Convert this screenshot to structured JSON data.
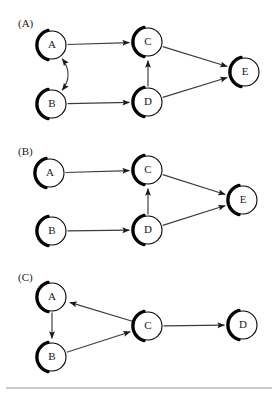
{
  "figure": {
    "title": "",
    "background_color": "#ffffff",
    "node_fill": "#ffffff",
    "node_stroke": "#000000",
    "edge_color": "#3c3c3c",
    "label_color": "#1a1a1a",
    "divider_color": "#8a8a8a",
    "node_radius": 14,
    "width": 277,
    "height": 394
  },
  "panels": [
    {
      "id": "panel-a",
      "label": "(A)",
      "label_x": 18,
      "label_y": 27,
      "nodes": [
        {
          "id": "A",
          "label": "A",
          "x": 52,
          "y": 45
        },
        {
          "id": "B",
          "label": "B",
          "x": 52,
          "y": 104
        },
        {
          "id": "C",
          "label": "C",
          "x": 148,
          "y": 42
        },
        {
          "id": "D",
          "label": "D",
          "x": 148,
          "y": 102
        },
        {
          "id": "E",
          "label": "E",
          "x": 245,
          "y": 72
        }
      ],
      "edges": [
        {
          "from": "A",
          "to": "C",
          "type": "straight",
          "arrow": "end"
        },
        {
          "from": "B",
          "to": "D",
          "type": "straight",
          "arrow": "end"
        },
        {
          "from": "D",
          "to": "C",
          "type": "straight",
          "arrow": "end"
        },
        {
          "from": "C",
          "to": "E",
          "type": "straight",
          "arrow": "end"
        },
        {
          "from": "D",
          "to": "E",
          "type": "straight",
          "arrow": "end"
        },
        {
          "from": "A",
          "to": "B",
          "type": "curved",
          "arrow": "both",
          "bulge": -22
        }
      ]
    },
    {
      "id": "panel-b",
      "label": "(B)",
      "label_x": 18,
      "label_y": 155,
      "nodes": [
        {
          "id": "A",
          "label": "A",
          "x": 50,
          "y": 173
        },
        {
          "id": "B",
          "label": "B",
          "x": 52,
          "y": 231
        },
        {
          "id": "C",
          "label": "C",
          "x": 148,
          "y": 170
        },
        {
          "id": "D",
          "label": "D",
          "x": 148,
          "y": 230
        },
        {
          "id": "E",
          "label": "E",
          "x": 243,
          "y": 200
        }
      ],
      "edges": [
        {
          "from": "A",
          "to": "C",
          "type": "straight",
          "arrow": "end"
        },
        {
          "from": "B",
          "to": "D",
          "type": "straight",
          "arrow": "end"
        },
        {
          "from": "D",
          "to": "C",
          "type": "straight",
          "arrow": "end"
        },
        {
          "from": "C",
          "to": "E",
          "type": "straight",
          "arrow": "end"
        },
        {
          "from": "D",
          "to": "E",
          "type": "straight",
          "arrow": "end"
        }
      ]
    },
    {
      "id": "panel-c",
      "label": "(C)",
      "label_x": 18,
      "label_y": 281,
      "nodes": [
        {
          "id": "A",
          "label": "A",
          "x": 52,
          "y": 297
        },
        {
          "id": "B",
          "label": "B",
          "x": 52,
          "y": 357
        },
        {
          "id": "C",
          "label": "C",
          "x": 148,
          "y": 326
        },
        {
          "id": "D",
          "label": "D",
          "x": 243,
          "y": 325
        }
      ],
      "edges": [
        {
          "from": "A",
          "to": "B",
          "type": "straight",
          "arrow": "end"
        },
        {
          "from": "B",
          "to": "C",
          "type": "straight",
          "arrow": "end"
        },
        {
          "from": "C",
          "to": "A",
          "type": "straight",
          "arrow": "end"
        },
        {
          "from": "C",
          "to": "D",
          "type": "straight",
          "arrow": "end"
        }
      ]
    }
  ],
  "divider": {
    "x1": 6,
    "y1": 388,
    "x2": 272,
    "y2": 388
  }
}
